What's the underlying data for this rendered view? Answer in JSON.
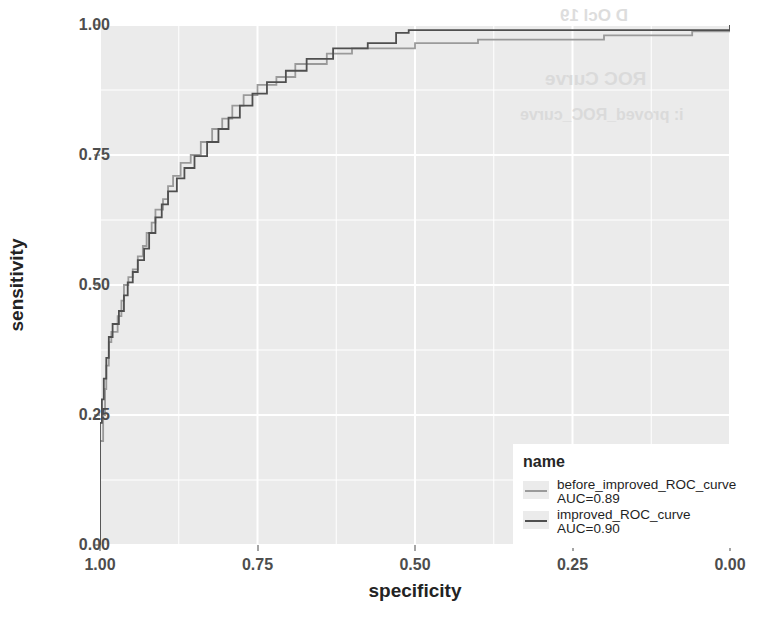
{
  "chart_data": {
    "type": "line",
    "title": "",
    "xlabel": "specificity",
    "ylabel": "sensitivity",
    "xlim": [
      1.0,
      0.0
    ],
    "ylim": [
      0.0,
      1.0
    ],
    "x_reversed": true,
    "grid": true,
    "legend_position": "bottom-right",
    "legend_title": "name",
    "xticks": [
      "1.00",
      "0.75",
      "0.50",
      "0.25",
      "0.00"
    ],
    "xtick_values": [
      1.0,
      0.75,
      0.5,
      0.25,
      0.0
    ],
    "yticks": [
      "0.00",
      "0.25",
      "0.50",
      "0.75",
      "1.00"
    ],
    "ytick_values": [
      0.0,
      0.25,
      0.5,
      0.75,
      1.0
    ],
    "series": [
      {
        "name": "before_improved_ROC_curve",
        "auc_label": "AUC=0.89",
        "auc": 0.89,
        "color": "#9a9a9a",
        "points": [
          [
            1.0,
            0.0
          ],
          [
            1.0,
            0.2
          ],
          [
            0.995,
            0.2
          ],
          [
            0.995,
            0.25
          ],
          [
            0.992,
            0.25
          ],
          [
            0.992,
            0.3
          ],
          [
            0.99,
            0.3
          ],
          [
            0.99,
            0.345
          ],
          [
            0.986,
            0.345
          ],
          [
            0.986,
            0.39
          ],
          [
            0.982,
            0.39
          ],
          [
            0.982,
            0.41
          ],
          [
            0.972,
            0.41
          ],
          [
            0.972,
            0.44
          ],
          [
            0.966,
            0.44
          ],
          [
            0.966,
            0.47
          ],
          [
            0.962,
            0.47
          ],
          [
            0.962,
            0.5
          ],
          [
            0.955,
            0.5
          ],
          [
            0.955,
            0.515
          ],
          [
            0.948,
            0.515
          ],
          [
            0.948,
            0.53
          ],
          [
            0.94,
            0.53
          ],
          [
            0.94,
            0.555
          ],
          [
            0.932,
            0.555
          ],
          [
            0.932,
            0.575
          ],
          [
            0.926,
            0.575
          ],
          [
            0.926,
            0.6
          ],
          [
            0.918,
            0.6
          ],
          [
            0.918,
            0.62
          ],
          [
            0.912,
            0.62
          ],
          [
            0.912,
            0.645
          ],
          [
            0.9,
            0.645
          ],
          [
            0.9,
            0.665
          ],
          [
            0.892,
            0.665
          ],
          [
            0.892,
            0.69
          ],
          [
            0.884,
            0.69
          ],
          [
            0.884,
            0.71
          ],
          [
            0.872,
            0.71
          ],
          [
            0.872,
            0.735
          ],
          [
            0.856,
            0.735
          ],
          [
            0.856,
            0.75
          ],
          [
            0.84,
            0.75
          ],
          [
            0.84,
            0.775
          ],
          [
            0.822,
            0.775
          ],
          [
            0.822,
            0.8
          ],
          [
            0.806,
            0.8
          ],
          [
            0.806,
            0.82
          ],
          [
            0.79,
            0.82
          ],
          [
            0.79,
            0.845
          ],
          [
            0.772,
            0.845
          ],
          [
            0.772,
            0.865
          ],
          [
            0.75,
            0.865
          ],
          [
            0.75,
            0.885
          ],
          [
            0.72,
            0.885
          ],
          [
            0.72,
            0.9
          ],
          [
            0.69,
            0.9
          ],
          [
            0.69,
            0.925
          ],
          [
            0.64,
            0.925
          ],
          [
            0.64,
            0.945
          ],
          [
            0.6,
            0.945
          ],
          [
            0.6,
            0.955
          ],
          [
            0.5,
            0.955
          ],
          [
            0.5,
            0.965
          ],
          [
            0.4,
            0.965
          ],
          [
            0.4,
            0.972
          ],
          [
            0.2,
            0.972
          ],
          [
            0.2,
            0.98
          ],
          [
            0.06,
            0.98
          ],
          [
            0.06,
            0.988
          ],
          [
            0.0,
            0.988
          ],
          [
            0.0,
            1.0
          ]
        ]
      },
      {
        "name": "improved_ROC_curve",
        "auc_label": "AUC=0.90",
        "auc": 0.9,
        "color": "#4f4f4f",
        "points": [
          [
            1.0,
            0.0
          ],
          [
            1.0,
            0.235
          ],
          [
            0.997,
            0.235
          ],
          [
            0.997,
            0.28
          ],
          [
            0.994,
            0.28
          ],
          [
            0.994,
            0.32
          ],
          [
            0.99,
            0.32
          ],
          [
            0.99,
            0.36
          ],
          [
            0.986,
            0.36
          ],
          [
            0.986,
            0.4
          ],
          [
            0.98,
            0.4
          ],
          [
            0.98,
            0.425
          ],
          [
            0.97,
            0.425
          ],
          [
            0.97,
            0.45
          ],
          [
            0.962,
            0.45
          ],
          [
            0.962,
            0.48
          ],
          [
            0.956,
            0.48
          ],
          [
            0.956,
            0.505
          ],
          [
            0.948,
            0.505
          ],
          [
            0.948,
            0.525
          ],
          [
            0.94,
            0.525
          ],
          [
            0.94,
            0.548
          ],
          [
            0.93,
            0.548
          ],
          [
            0.93,
            0.57
          ],
          [
            0.922,
            0.57
          ],
          [
            0.922,
            0.6
          ],
          [
            0.912,
            0.6
          ],
          [
            0.912,
            0.63
          ],
          [
            0.902,
            0.63
          ],
          [
            0.902,
            0.655
          ],
          [
            0.892,
            0.655
          ],
          [
            0.892,
            0.68
          ],
          [
            0.878,
            0.68
          ],
          [
            0.878,
            0.705
          ],
          [
            0.866,
            0.705
          ],
          [
            0.866,
            0.725
          ],
          [
            0.85,
            0.725
          ],
          [
            0.85,
            0.748
          ],
          [
            0.83,
            0.748
          ],
          [
            0.83,
            0.775
          ],
          [
            0.812,
            0.775
          ],
          [
            0.812,
            0.8
          ],
          [
            0.796,
            0.8
          ],
          [
            0.796,
            0.822
          ],
          [
            0.778,
            0.822
          ],
          [
            0.778,
            0.845
          ],
          [
            0.758,
            0.845
          ],
          [
            0.758,
            0.868
          ],
          [
            0.735,
            0.868
          ],
          [
            0.735,
            0.89
          ],
          [
            0.705,
            0.89
          ],
          [
            0.705,
            0.912
          ],
          [
            0.672,
            0.912
          ],
          [
            0.672,
            0.935
          ],
          [
            0.63,
            0.935
          ],
          [
            0.63,
            0.955
          ],
          [
            0.575,
            0.955
          ],
          [
            0.575,
            0.965
          ],
          [
            0.53,
            0.965
          ],
          [
            0.53,
            0.985
          ],
          [
            0.51,
            0.985
          ],
          [
            0.51,
            0.99
          ],
          [
            0.0,
            0.99
          ],
          [
            0.0,
            1.0
          ]
        ]
      }
    ]
  },
  "axes": {
    "x_title": "specificity",
    "y_title": "sensitivity"
  },
  "legend": {
    "title": "name",
    "entries": [
      {
        "label": "before_improved_ROC_curve",
        "auc": "AUC=0.89"
      },
      {
        "label": "improved_ROC_curve",
        "auc": "AUC=0.90"
      }
    ]
  },
  "ghost": [
    {
      "text": "D  Ocl 19",
      "x": 560,
      "y": 6,
      "size": 17
    },
    {
      "text": "ROC Curve",
      "x": 545,
      "y": 68,
      "size": 19
    },
    {
      "text": "i: proved_ROC_curve",
      "x": 520,
      "y": 106,
      "size": 16
    }
  ],
  "theme": {
    "panel_background": "#ebebeb",
    "grid_color": "#ffffff",
    "page_background": "#ffffff",
    "tick_label_color": "#4d4d4d",
    "axis_title_color": "#232323"
  }
}
